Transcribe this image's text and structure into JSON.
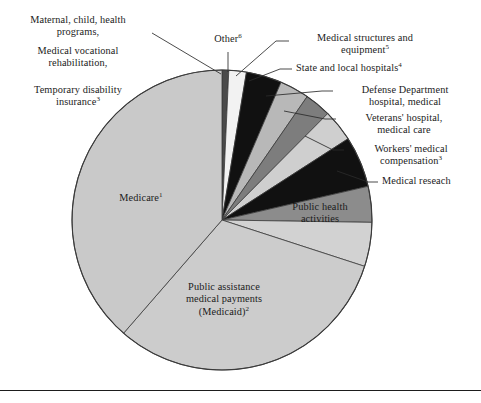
{
  "figure": {
    "title": "",
    "background": "#ffffff",
    "center": {
      "x": 222,
      "y": 220
    },
    "radius": 150,
    "outline_color": "#3a3a3a",
    "leader_color": "#2b2b2b",
    "footer_rule_y": 390
  },
  "labels": {
    "maternal": {
      "line1": "Maternal, child, health",
      "line2": "programs,"
    },
    "vocational": {
      "line1": "Medical vocational",
      "line2": "rehabilitation,"
    },
    "temp_disability": {
      "line1": "Temporary disability",
      "line2": "insurance",
      "sup": "3"
    },
    "other": {
      "line1": "Other",
      "sup": "6"
    },
    "structures": {
      "line1": "Medical structures and",
      "line2": "equipment",
      "sup": "5"
    },
    "state_local": {
      "line1": "State and local hospitals",
      "sup": "4"
    },
    "defense": {
      "line1": "Defense Department",
      "line2": "hospital, medical"
    },
    "veterans": {
      "line1": "Veterans' hospital,",
      "line2": "medical care"
    },
    "workers": {
      "line1": "Workers' medical",
      "line2": "compensation",
      "sup": "3"
    },
    "research": {
      "line1": "Medical reseach"
    },
    "public_health": {
      "line1": "Public health",
      "line2": "activities"
    },
    "medicare": {
      "line1": "Medicare",
      "sup": "1"
    },
    "medicaid": {
      "line1": "Public assistance",
      "line2": "medical payments",
      "line3": "(Medicaid)",
      "sup": "2"
    }
  },
  "chart_data": {
    "type": "pie",
    "title": "",
    "xlabel": "",
    "ylabel": "",
    "legend_position": "none",
    "grid": false,
    "start_angle_deg": 0,
    "direction": "clockwise",
    "units": "percent of total national health expenditure by program",
    "categories": [
      "Maternal, child, health programs, Medical vocational rehabilitation, Temporary disability insurance",
      "Other",
      "Medical structures and equipment",
      "State and local hospitals",
      "Defense Department hospital, medical",
      "Veterans' hospital, medical care",
      "Workers' medical compensation",
      "Medical reseach",
      "Public health activities",
      "Public assistance medical payments (Medicaid)",
      "Medicare"
    ],
    "values": [
      1.2,
      2.1,
      4.3,
      3.5,
      3.1,
      3.8,
      6.1,
      4.3,
      6.6,
      32.0,
      33.0
    ],
    "colors": [
      "#4a4a4a",
      "#f2f2f2",
      "#111111",
      "#b8b8b8",
      "#7d7d7d",
      "#cfcfcf",
      "#111111",
      "#8c8c8c",
      "#d2d2d2",
      "#cccccc",
      "#c9c9c9"
    ],
    "slice_angles_deg": [
      {
        "name": "Maternal, child, health programs, Medical vocational rehabilitation, Temporary disability insurance",
        "start": 270.0,
        "end": 272.6
      },
      {
        "name": "Other",
        "start": 272.6,
        "end": 279.4
      },
      {
        "name": "Medical structures and equipment",
        "start": 279.4,
        "end": 293.2
      },
      {
        "name": "State and local hospitals",
        "start": 293.2,
        "end": 304.6
      },
      {
        "name": "Defense Department hospital, medical",
        "start": 304.6,
        "end": 314.8
      },
      {
        "name": "Veterans' hospital, medical care",
        "start": 314.8,
        "end": 327.2
      },
      {
        "name": "Workers' medical compensation",
        "start": 327.2,
        "end": 347.0
      },
      {
        "name": "Medical reseach",
        "start": 347.0,
        "end": 0.9
      },
      {
        "name": "Public health activities",
        "start": 0.9,
        "end": 18.0
      },
      {
        "name": "Public assistance medical payments (Medicaid)",
        "start": 18.0,
        "end": 131.0
      },
      {
        "name": "Medicare",
        "start": 131.0,
        "end": 270.0
      }
    ]
  }
}
